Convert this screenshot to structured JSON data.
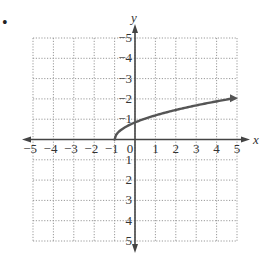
{
  "bullet": "•",
  "chart_data": {
    "type": "line",
    "title": "",
    "xlabel": "x",
    "ylabel": "y",
    "xlim": [
      -5,
      5
    ],
    "ylim": [
      -5,
      5
    ],
    "grid": true,
    "grid_style": "dotted",
    "x_ticks": [
      -5,
      -4,
      -3,
      -2,
      -1,
      0,
      1,
      2,
      3,
      4,
      5
    ],
    "y_ticks": [
      -5,
      -4,
      -3,
      -2,
      -1,
      1,
      2,
      3,
      4,
      5
    ],
    "x_tick_labels": [
      "−5",
      "−4",
      "−3",
      "−2",
      "−1",
      "0",
      "1",
      "2",
      "3",
      "4",
      "5"
    ],
    "y_tick_labels": [
      "5",
      "4",
      "3",
      "2",
      "1",
      "−1",
      "−2",
      "−3",
      "−4",
      "−5"
    ],
    "series": [
      {
        "name": "f(x) = √(x+1)",
        "x": [
          -1,
          -0.75,
          -0.5,
          0,
          1,
          2,
          3,
          4,
          5
        ],
        "y": [
          0,
          0.5,
          0.71,
          1,
          1.41,
          1.73,
          2,
          2.24,
          2.45
        ],
        "end_arrow": true,
        "color": "#555555"
      }
    ],
    "axis_color": "#444444",
    "grid_color": "#999999"
  }
}
